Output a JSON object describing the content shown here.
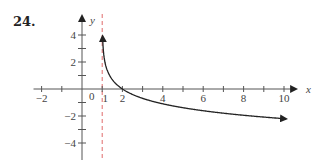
{
  "problem": {
    "number": "24."
  },
  "axes": {
    "x_label": "x",
    "y_label": "y",
    "origin_label": "0",
    "x_ticks": [
      {
        "value": -2,
        "label": "−2"
      },
      {
        "value": 2,
        "label": "2"
      },
      {
        "value": 4,
        "label": "4"
      },
      {
        "value": 6,
        "label": "6"
      },
      {
        "value": 8,
        "label": "8"
      },
      {
        "value": 10,
        "label": "10"
      }
    ],
    "x_one_label": "1",
    "y_ticks": [
      {
        "value": 4,
        "label": "4"
      },
      {
        "value": 2,
        "label": "2"
      },
      {
        "value": -2,
        "label": "−2"
      },
      {
        "value": -4,
        "label": "−4"
      }
    ]
  },
  "colors": {
    "axis": "#555555",
    "curve": "#222222",
    "asymptote": "#e06a6a"
  },
  "chart_data": {
    "type": "line",
    "title": "",
    "xlabel": "x",
    "ylabel": "y",
    "xlim": [
      -2,
      10.5
    ],
    "ylim": [
      -5,
      4.8
    ],
    "grid": false,
    "legend": null,
    "x_tick_labels": [
      "−2",
      "0",
      "1",
      "2",
      "4",
      "6",
      "8",
      "10"
    ],
    "y_tick_labels": [
      "4",
      "2",
      "−2",
      "−4"
    ],
    "annotations": [
      "vertical asymptote (dashed) at x = 1"
    ],
    "series": [
      {
        "name": "y = -ln(x - 1)",
        "x": [
          1.02,
          1.05,
          1.1,
          1.2,
          1.4,
          1.7,
          2,
          2.5,
          3,
          4,
          5,
          6,
          7,
          8,
          9,
          10
        ],
        "y": [
          3.91,
          3.0,
          2.3,
          1.61,
          0.92,
          0.36,
          0,
          -0.41,
          -0.69,
          -1.1,
          -1.39,
          -1.61,
          -1.79,
          -1.95,
          -2.08,
          -2.2
        ]
      }
    ],
    "asymptote": {
      "x": 1,
      "style": "dashed"
    }
  }
}
